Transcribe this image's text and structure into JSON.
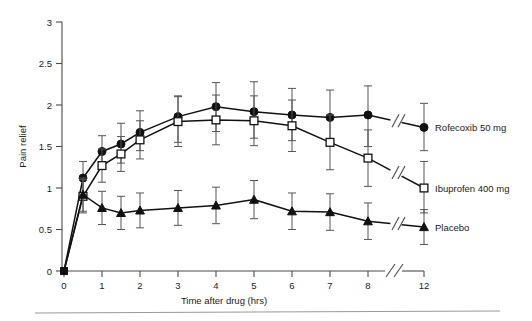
{
  "chart_data": {
    "type": "line",
    "title": "",
    "xlabel": "Time after drug (hrs)",
    "ylabel": "Pain relief",
    "xlim": [
      0,
      12
    ],
    "ylim": [
      0,
      3
    ],
    "grid": false,
    "legend_position": "right-inline",
    "x_ticks": [
      "0",
      "1",
      "2",
      "3",
      "4",
      "5",
      "6",
      "7",
      "8",
      "12"
    ],
    "x_tick_values": [
      0,
      1,
      2,
      3,
      4,
      5,
      6,
      7,
      8,
      12
    ],
    "y_ticks": [
      "0",
      "0.5",
      "1",
      "1.5",
      "2",
      "2.5",
      "3"
    ],
    "y_tick_values": [
      0,
      0.5,
      1,
      1.5,
      2,
      2.5,
      3
    ],
    "axis_break": {
      "present": true,
      "between": [
        8,
        12
      ],
      "glyph": "//"
    },
    "x": [
      0,
      0.5,
      1,
      1.5,
      2,
      3,
      4,
      5,
      6,
      7,
      8,
      12
    ],
    "series": [
      {
        "name": "Rofecoxib 50 mg",
        "marker": "filled-circle",
        "values": [
          0,
          1.12,
          1.44,
          1.53,
          1.67,
          1.86,
          1.98,
          1.92,
          1.88,
          1.85,
          1.88,
          1.73
        ],
        "err_low": [
          0,
          0.92,
          1.25,
          1.3,
          1.45,
          1.55,
          1.68,
          1.6,
          1.57,
          1.52,
          1.5,
          1.45
        ],
        "err_high": [
          0,
          1.32,
          1.63,
          1.78,
          1.93,
          2.11,
          2.27,
          2.28,
          2.2,
          2.18,
          2.23,
          2.02
        ]
      },
      {
        "name": "Ibuprofen 400 mg",
        "marker": "open-square",
        "values": [
          0,
          0.9,
          1.27,
          1.41,
          1.58,
          1.8,
          1.82,
          1.81,
          1.75,
          1.55,
          1.36,
          1.0
        ],
        "err_low": [
          0,
          0.7,
          1.07,
          1.2,
          1.35,
          1.5,
          1.52,
          1.51,
          1.44,
          1.22,
          1.02,
          0.7
        ],
        "err_high": [
          0,
          1.1,
          1.47,
          1.62,
          1.81,
          2.1,
          2.12,
          2.11,
          2.06,
          1.88,
          1.7,
          1.32
        ]
      },
      {
        "name": "Placebo",
        "marker": "filled-triangle",
        "values": [
          0,
          0.92,
          0.76,
          0.7,
          0.73,
          0.76,
          0.79,
          0.86,
          0.72,
          0.71,
          0.6,
          0.53
        ],
        "err_low": [
          0,
          0.72,
          0.56,
          0.5,
          0.52,
          0.55,
          0.57,
          0.63,
          0.5,
          0.49,
          0.38,
          0.32
        ],
        "err_high": [
          0,
          1.12,
          0.96,
          0.9,
          0.94,
          0.97,
          1.01,
          1.09,
          0.94,
          0.93,
          0.82,
          0.74
        ]
      }
    ]
  }
}
